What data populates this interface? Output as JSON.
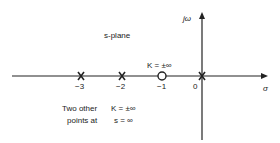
{
  "diagram": {
    "plane_label": "s-plane",
    "axes": {
      "x_label": "σ",
      "y_label": "jω"
    },
    "ticks": [
      {
        "value": -3,
        "label": "−3"
      },
      {
        "value": -2,
        "label": "−2"
      },
      {
        "value": -1,
        "label": "−1"
      },
      {
        "value": 0,
        "label": "0"
      }
    ],
    "poles": [
      -3,
      -2,
      0
    ],
    "zeros": [
      -1
    ],
    "zero_annotation": "K = ±∞",
    "note": {
      "line1_left": "Two other",
      "line2_left": "points at",
      "line1_right": "K = ±∞",
      "line2_right": "s = ∞"
    }
  }
}
